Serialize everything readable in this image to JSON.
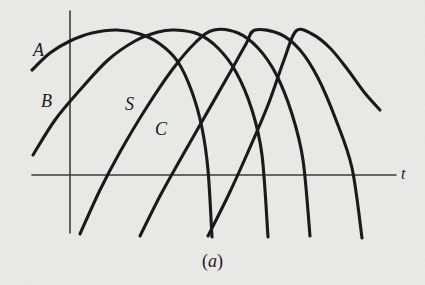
{
  "figure": {
    "caption_prefix": "(",
    "caption_label": "a",
    "caption_suffix": ")",
    "caption_full": "(a)",
    "background_color": "#e9e9e7",
    "ink_color": "#17171a",
    "axis_color": "#3a3a3c"
  },
  "axes": {
    "t_axis_label": "t",
    "t_axis": {
      "x_start": 32,
      "x_end": 396,
      "y": 175
    },
    "v_axis": {
      "x": 70,
      "y_start": 11,
      "y_end": 233
    },
    "origin": {
      "x": 70,
      "y": 175
    }
  },
  "labels": [
    {
      "name": "A",
      "text": "A",
      "x": 33,
      "y": 41
    },
    {
      "name": "B",
      "text": "B",
      "x": 41,
      "y": 92
    },
    {
      "name": "S",
      "text": "S",
      "x": 125,
      "y": 95
    },
    {
      "name": "C",
      "text": "C",
      "x": 155,
      "y": 120
    },
    {
      "name": "t",
      "text": "t",
      "x": 400,
      "y": 166
    }
  ],
  "chart_data": {
    "type": "line",
    "title": "(a)",
    "xlabel": "t",
    "ylabel": "",
    "grid": false,
    "legend": "inline-labels",
    "xlim": [
      0,
      425
    ],
    "ylim": [
      285,
      0
    ],
    "axis_crossings_px": [
      70,
      128,
      185,
      245,
      302,
      372
    ],
    "series": [
      {
        "name": "A",
        "label": "A",
        "peak": {
          "x": 117,
          "y": 30
        },
        "start": {
          "x": 32,
          "y": 70
        },
        "end": {
          "x": 212,
          "y": 237
        },
        "points": [
          [
            32,
            70
          ],
          [
            50,
            53
          ],
          [
            70,
            41
          ],
          [
            92,
            33
          ],
          [
            117,
            30
          ],
          [
            140,
            34
          ],
          [
            160,
            44
          ],
          [
            178,
            62
          ],
          [
            192,
            92
          ],
          [
            202,
            128
          ],
          [
            208,
            170
          ],
          [
            212,
            237
          ]
        ]
      },
      {
        "name": "B",
        "label": "B",
        "peak": {
          "x": 175,
          "y": 30
        },
        "start": {
          "x": 33,
          "y": 155
        },
        "end": {
          "x": 268,
          "y": 237
        },
        "points": [
          [
            33,
            155
          ],
          [
            55,
            120
          ],
          [
            80,
            90
          ],
          [
            108,
            60
          ],
          [
            135,
            41
          ],
          [
            158,
            32
          ],
          [
            175,
            30
          ],
          [
            198,
            34
          ],
          [
            218,
            48
          ],
          [
            236,
            72
          ],
          [
            252,
            110
          ],
          [
            262,
            155
          ],
          [
            268,
            237
          ]
        ]
      },
      {
        "name": "S",
        "label": "S",
        "peak": {
          "x": 214,
          "y": 30
        },
        "start": {
          "x": 80,
          "y": 234
        },
        "end": {
          "x": 310,
          "y": 236
        },
        "points": [
          [
            80,
            234
          ],
          [
            100,
            190
          ],
          [
            120,
            152
          ],
          [
            145,
            110
          ],
          [
            172,
            70
          ],
          [
            196,
            42
          ],
          [
            214,
            30
          ],
          [
            238,
            33
          ],
          [
            258,
            48
          ],
          [
            276,
            74
          ],
          [
            292,
            114
          ],
          [
            303,
            160
          ],
          [
            310,
            236
          ]
        ]
      },
      {
        "name": "C",
        "label": "C",
        "peak": {
          "x": 255,
          "y": 30
        },
        "start": {
          "x": 140,
          "y": 236
        },
        "end": {
          "x": 362,
          "y": 238
        },
        "points": [
          [
            140,
            236
          ],
          [
            160,
            196
          ],
          [
            180,
            160
          ],
          [
            204,
            118
          ],
          [
            228,
            76
          ],
          [
            246,
            44
          ],
          [
            255,
            30
          ],
          [
            280,
            34
          ],
          [
            300,
            50
          ],
          [
            318,
            78
          ],
          [
            336,
            120
          ],
          [
            352,
            168
          ],
          [
            362,
            238
          ]
        ]
      },
      {
        "name": "E",
        "label": "",
        "peak": {
          "x": 296,
          "y": 31
        },
        "start": {
          "x": 208,
          "y": 236
        },
        "end": {
          "x": 380,
          "y": 110
        },
        "points": [
          [
            208,
            236
          ],
          [
            228,
            196
          ],
          [
            248,
            152
          ],
          [
            268,
            105
          ],
          [
            284,
            60
          ],
          [
            296,
            31
          ],
          [
            312,
            34
          ],
          [
            330,
            48
          ],
          [
            348,
            70
          ],
          [
            364,
            92
          ],
          [
            380,
            110
          ]
        ]
      }
    ]
  }
}
